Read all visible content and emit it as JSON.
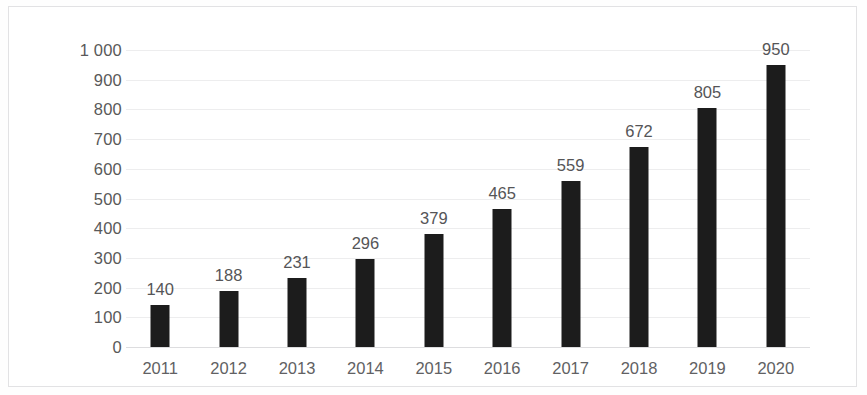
{
  "chart_data": {
    "type": "bar",
    "title": "",
    "subtitle": "",
    "xlabel": "",
    "ylabel": "",
    "categories": [
      "2011",
      "2012",
      "2013",
      "2014",
      "2015",
      "2016",
      "2017",
      "2018",
      "2019",
      "2020"
    ],
    "values": [
      140,
      188,
      231,
      296,
      379,
      465,
      559,
      672,
      805,
      950
    ],
    "data_labels": [
      "140",
      "188",
      "231",
      "296",
      "379",
      "465",
      "559",
      "672",
      "805",
      "950"
    ],
    "ylim": [
      0,
      1000
    ],
    "y_ticks": [
      0,
      100,
      200,
      300,
      400,
      500,
      600,
      700,
      800,
      900,
      1000
    ],
    "y_tick_labels": [
      "0",
      "100",
      "200",
      "300",
      "400",
      "500",
      "600",
      "700",
      "800",
      "900",
      "1 000"
    ],
    "grid": true,
    "legend": false,
    "legend_position": "none",
    "bar_color": "#1c1c1c",
    "gridline_color": "#ededee",
    "label_color": "#555557",
    "axis_label_color": "#616163",
    "frame_color": "#e2e2e4",
    "background_color": "#ffffff"
  }
}
